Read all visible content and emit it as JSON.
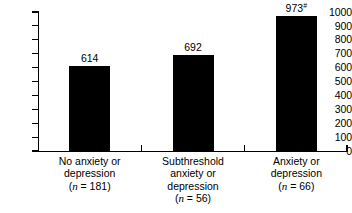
{
  "chart_data": {
    "type": "bar",
    "title": "",
    "subtitle": "",
    "xlabel": "",
    "ylabel": "",
    "ylim": [
      0,
      1000
    ],
    "ytick_step": 100,
    "grid": false,
    "legend": false,
    "bar_color": "#000000",
    "background_color": "#ffffff",
    "categories": [
      "No anxiety or depression",
      "Subthreshold anxiety or depression",
      "Anxiety or depression"
    ],
    "values": [
      614,
      692,
      973
    ],
    "value_labels": [
      "614",
      "692",
      "973"
    ],
    "value_label_marks": [
      "",
      "",
      "#"
    ],
    "group_sizes": [
      181,
      56,
      66
    ],
    "yticks": [
      "0",
      "100",
      "200",
      "300",
      "400",
      "500",
      "600",
      "700",
      "800",
      "900",
      "1000"
    ],
    "category_lines": [
      [
        "No anxiety or",
        "depression"
      ],
      [
        "Subthreshold",
        "anxiety or",
        "depression"
      ],
      [
        "Anxiety or",
        "depression"
      ]
    ],
    "n_labels": [
      "(n = 181)",
      "(n = 56)",
      "(n = 66)"
    ],
    "n_prefix": "(",
    "n_symbol": "n",
    "n_equals": " = ",
    "n_suffix": ")"
  }
}
